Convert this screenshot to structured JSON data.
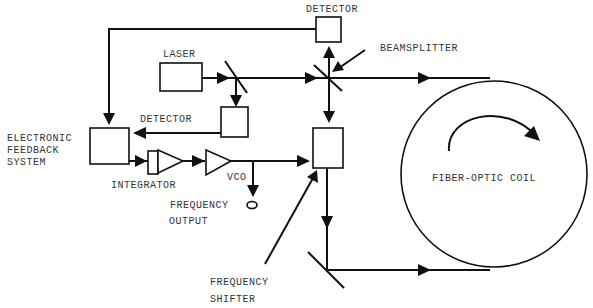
{
  "labels": {
    "detector_top": "DETECTOR",
    "beamsplitter": "BEAMSPLITTER",
    "laser": "LASER",
    "detector_mid": "DETECTOR",
    "feedback_1": "ELECTRONIC",
    "feedback_2": "FEEDBACK",
    "feedback_3": "SYSTEM",
    "integrator": "INTEGRATOR",
    "vco": "VCO",
    "freq_out_1": "FREQUENCY",
    "freq_out_2": "OUTPUT",
    "shifter_1": "FREQUENCY",
    "shifter_2": "SHIFTER",
    "coil": "FIBER-OPTIC COIL"
  },
  "colors": {
    "line": "#111111",
    "text": "#333333",
    "background": "#ffffff"
  }
}
